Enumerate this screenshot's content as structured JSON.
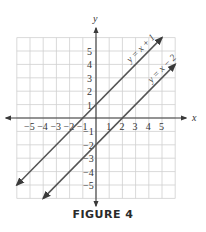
{
  "figure": {
    "caption": "FIGURE 4"
  },
  "chart_data": {
    "type": "line",
    "title": "",
    "xlabel": "x",
    "ylabel": "y",
    "xlim": [
      -6,
      6
    ],
    "ylim": [
      -6,
      6
    ],
    "grid": true,
    "x_tick_labels": [
      "-5",
      "-4",
      "-3",
      "-2",
      "-1",
      "1",
      "2",
      "3",
      "4",
      "5"
    ],
    "y_tick_labels": [
      "5",
      "4",
      "3",
      "2",
      "1",
      "-1",
      "-2",
      "-3",
      "-4",
      "-5"
    ],
    "series": [
      {
        "name": "y = x + 1",
        "slope": 1,
        "intercept": 1,
        "x": [
          -6,
          5
        ],
        "y": [
          -5,
          6
        ],
        "arrows": "both"
      },
      {
        "name": "y = x − 2",
        "slope": 1,
        "intercept": -2,
        "x": [
          -4,
          6
        ],
        "y": [
          -6,
          4
        ],
        "arrows": "both"
      }
    ],
    "annotations": [
      {
        "text": "y = x + 1",
        "along_line": "y = x + 1"
      },
      {
        "text": "y = x − 2",
        "along_line": "y = x − 2"
      }
    ],
    "colors": {
      "grid": "#c8c8c8",
      "axis": "#3a3a3a",
      "line": "#555555",
      "text": "#333333"
    }
  }
}
